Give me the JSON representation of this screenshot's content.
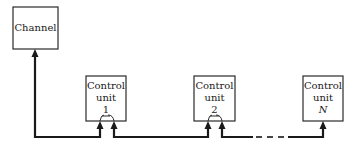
{
  "diagram": {
    "channel": {
      "label": "Channel"
    },
    "control_units": [
      {
        "line1": "Control",
        "line2": "unit",
        "id": "1"
      },
      {
        "line1": "Control",
        "line2": "unit",
        "id": "2"
      },
      {
        "line1": "Control",
        "line2": "unit",
        "id": "N"
      }
    ],
    "colors": {
      "stroke": "#1a1a1a",
      "background": "#ffffff"
    }
  }
}
